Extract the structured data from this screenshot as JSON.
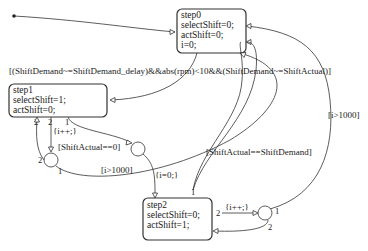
{
  "diagram": {
    "type": "stateflow-chart",
    "states": [
      {
        "id": "step0",
        "lines": [
          "step0",
          "selectShift=0;",
          "actShift=0;",
          "i=0;"
        ]
      },
      {
        "id": "step1",
        "lines": [
          "step1",
          "selectShift=1;",
          "actShift=0;"
        ]
      },
      {
        "id": "step2",
        "lines": [
          "step2",
          "selectShift=0;",
          "actShift=1;"
        ]
      }
    ],
    "transitions": {
      "step0_to_step1": "[(ShiftDemand~=ShiftDemand_delay)&&abs(rpm)<10&&(ShiftDemand~=ShiftActual)]",
      "step1_counter": "{i++;}",
      "step1_shift_actual": "[ShiftActual==0]",
      "step1_timeout": "[i>1000]",
      "to_step2_action": "{i=0;}",
      "step2_to_step0": "[ShiftActual==ShiftDemand]",
      "step2_timeout": "[i>1000]",
      "step2_counter": "{i++;}"
    },
    "execution_orders": {
      "step1_a": "2",
      "step1_b": "2",
      "step1_c": "1",
      "junction1_a": "2",
      "junction1_b": "1",
      "step2_top": "1",
      "step2_right": "2",
      "junction3_a": "1",
      "junction3_b": "2"
    }
  }
}
